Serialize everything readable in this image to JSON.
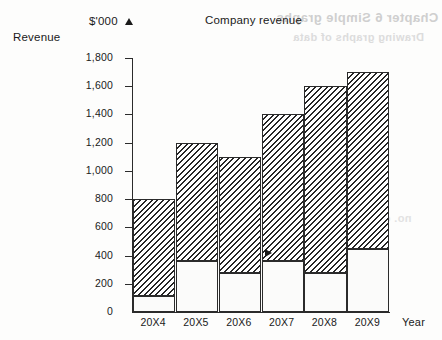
{
  "side_label": "Revenue",
  "x_axis_title": "Year",
  "bleed_through": {
    "line1": "Chapter 6 Simple graphs",
    "line2": "Drawing graphs of data",
    "line3": "no. of items"
  },
  "chart_data": {
    "type": "bar",
    "title": "Company revenue",
    "xlabel": "Year",
    "ylabel": "$'000",
    "stacked": true,
    "grid": false,
    "legend": "none",
    "ylim": [
      0,
      1800
    ],
    "ytick_step": 200,
    "ytick_labels": [
      "0",
      "200",
      "400",
      "600",
      "800",
      "1,000",
      "1,200",
      "1,400",
      "1,600",
      "1,800"
    ],
    "ytick_values": [
      0,
      200,
      400,
      600,
      800,
      1000,
      1200,
      1400,
      1600,
      1800
    ],
    "categories": [
      "20X4",
      "20X5",
      "20X6",
      "20X7",
      "20X8",
      "20X9"
    ],
    "series": [
      {
        "name": "lower-segment",
        "fill": "plain",
        "values": [
          110,
          360,
          280,
          360,
          280,
          450
        ]
      },
      {
        "name": "upper-segment",
        "fill": "hatched",
        "values": [
          690,
          840,
          820,
          1040,
          1320,
          1250
        ]
      }
    ],
    "totals": [
      800,
      1200,
      1100,
      1400,
      1600,
      1700
    ]
  }
}
